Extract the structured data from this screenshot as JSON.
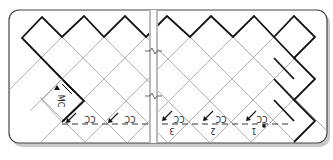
{
  "diagram": {
    "type": "corner-to-corner crochet chart",
    "frame": {
      "stroke": "#444444",
      "fill": "#ffffff",
      "shadow": "#bbbbbb"
    },
    "colors": {
      "grid_line": "#9a9a9a",
      "outline": "#111111",
      "dashed_line": "#333333",
      "break_line": "#777777"
    },
    "labels": {
      "contrast_color": "CC",
      "main_color": "MC"
    },
    "row_markers": [
      {
        "number": "1",
        "color_label": "CC",
        "has_dot": true
      },
      {
        "number": "2",
        "color_label": "CC",
        "has_dot": false
      },
      {
        "number": "3",
        "color_label": "CC",
        "has_dot": false
      },
      {
        "number": "",
        "color_label": "CC",
        "has_dot": false
      },
      {
        "number": "",
        "color_label": "CC",
        "has_dot": false
      }
    ],
    "break_symbol": "break-zigzag"
  }
}
